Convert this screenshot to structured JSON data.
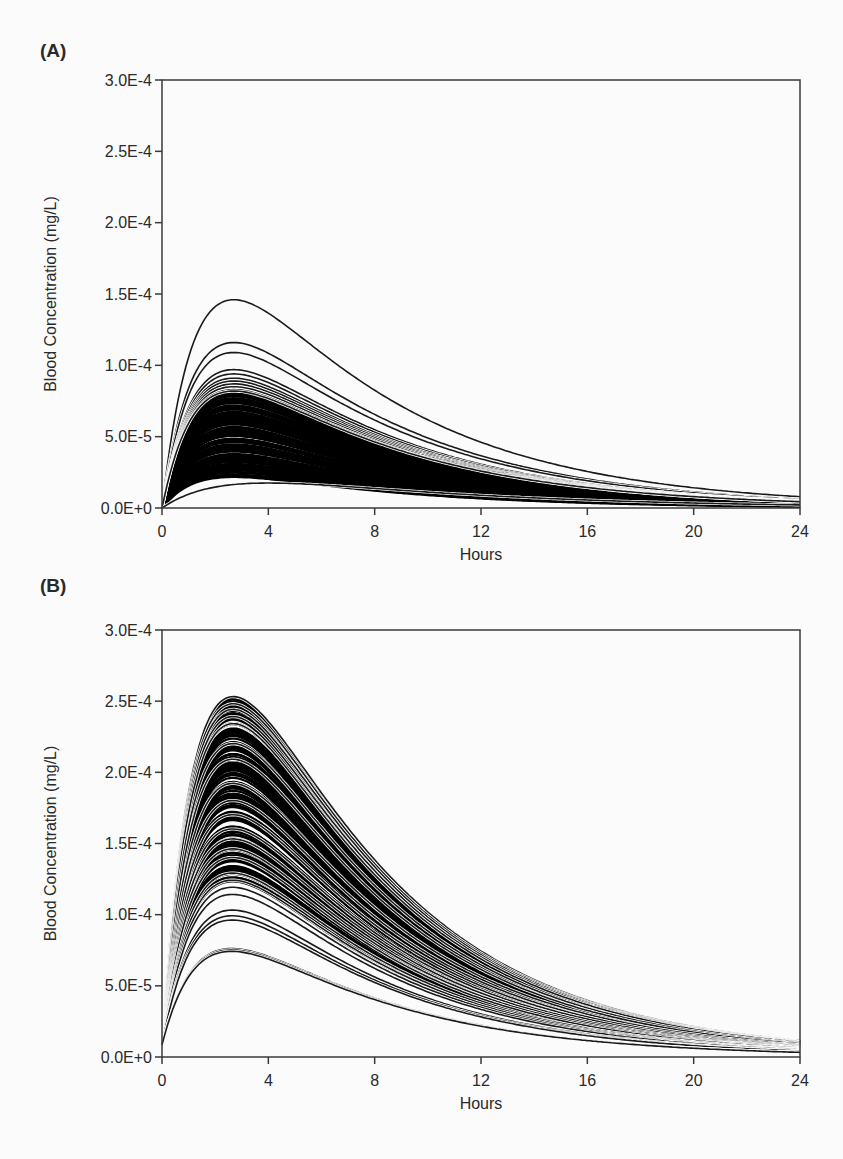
{
  "chart_data": [
    {
      "panel_label": "(A)",
      "type": "line",
      "title": "",
      "xlabel": "Hours",
      "ylabel": "Blood Concentration (mg/L)",
      "xlim": [
        0,
        24
      ],
      "ylim": [
        0,
        0.0003
      ],
      "xticks": [
        0,
        4,
        8,
        12,
        16,
        20,
        24
      ],
      "xtick_labels": [
        "0",
        "4",
        "8",
        "12",
        "16",
        "20",
        "24"
      ],
      "yticks": [
        0,
        5e-05,
        0.0001,
        0.00015,
        0.0002,
        0.00025,
        0.0003
      ],
      "ytick_labels": [
        "0.0E+0",
        "5.0E-5",
        "1.0E-4",
        "1.5E-4",
        "2.0E-4",
        "2.5E-4",
        "3.0E-4"
      ],
      "grid": false,
      "legend": null,
      "description": "Ensemble of many simulated concentration-time curves (absorption then elimination); dense black band",
      "peak_time_hours": 2.7,
      "baseline_at_t0": 0,
      "value_at_24h_ratio_to_peak": 0.053,
      "series_peaks": [
        0.000146,
        0.000116,
        0.000109,
        9.7e-05,
        9.4e-05,
        9.1e-05,
        8.9e-05,
        8.7e-05,
        8.5e-05,
        8.3e-05,
        8.2e-05
      ],
      "dense_band": {
        "peak_max": 8.2e-05,
        "peak_min": 2.2e-05,
        "count": 140
      },
      "lowest_series_peak": 1.75e-05,
      "lowest_series_peak_time_hours": 4.0
    },
    {
      "panel_label": "(B)",
      "type": "line",
      "title": "",
      "xlabel": "Hours",
      "ylabel": "Blood Concentration (mg/L)",
      "xlim": [
        0,
        24
      ],
      "ylim": [
        0,
        0.0003
      ],
      "xticks": [
        0,
        4,
        8,
        12,
        16,
        20,
        24
      ],
      "xtick_labels": [
        "0",
        "4",
        "8",
        "12",
        "16",
        "20",
        "24"
      ],
      "yticks": [
        0,
        5e-05,
        0.0001,
        0.00015,
        0.0002,
        0.00025,
        0.0003
      ],
      "ytick_labels": [
        "0.0E+0",
        "5.0E-5",
        "1.0E-4",
        "1.5E-4",
        "2.0E-4",
        "2.5E-4",
        "3.0E-4"
      ],
      "grid": false,
      "legend": null,
      "description": "Ensemble of many simulated concentration-time curves; dense black band with visible gaps",
      "peak_time_hours": 2.7,
      "baseline_at_t0": 8.5e-06,
      "value_at_24h_ratio_to_peak": 0.045,
      "series_peaks": [
        0.000255,
        0.00025,
        0.000246,
        0.000241,
        0.000236,
        0.000222,
        0.000211,
        0.000194,
        0.000182,
        0.000172,
        0.000162,
        0.000155,
        0.000148,
        0.000142,
        0.000131,
        0.000126,
        0.000121,
        0.000116,
        0.000105,
        0.000101,
        9.8e-05,
        7.8e-05,
        7.7e-05,
        7.6e-05
      ],
      "dense_band": {
        "peak_max": 0.000255,
        "peak_min": 0.000125,
        "count": 160
      }
    }
  ]
}
